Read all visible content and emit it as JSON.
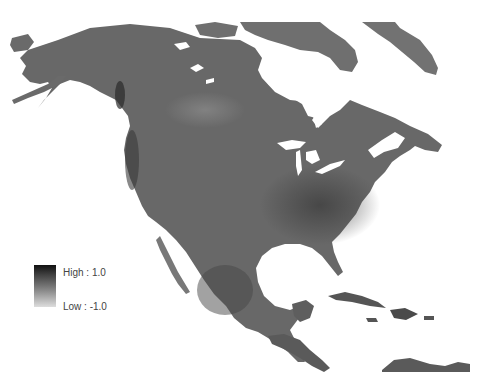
{
  "map": {
    "region": "North America",
    "colors": {
      "land_base": "#6e6e6e",
      "land_dark": "#4a4a4a",
      "land_darkest": "#2a2a2a",
      "land_light": "#8a8a8a",
      "water": "#ffffff"
    }
  },
  "legend": {
    "high_label": "High : 1.0",
    "low_label": "Low : -1.0",
    "high_value": 1.0,
    "low_value": -1.0,
    "gradient_top": "#111111",
    "gradient_bottom": "#dddddd"
  }
}
